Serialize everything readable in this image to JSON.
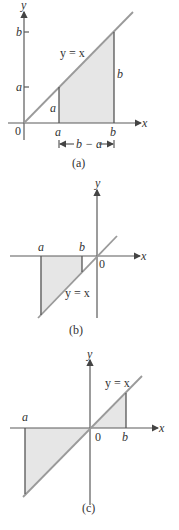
{
  "panels": [
    {
      "caption": "(a)",
      "axis_x": "x",
      "axis_y": "y",
      "origin": "0",
      "line_label": "y = x",
      "tick_a": "a",
      "tick_b": "b",
      "ytick_a": "a",
      "ytick_b": "b",
      "height_a": "a",
      "height_b": "b",
      "width_label": "b − a",
      "arrow_left": "|←",
      "arrow_right": "→|"
    },
    {
      "caption": "(b)",
      "axis_x": "x",
      "axis_y": "y",
      "origin": "0",
      "line_label": "y = x",
      "tick_a": "a",
      "tick_b": "b"
    },
    {
      "caption": "(c)",
      "axis_x": "x",
      "axis_y": "y",
      "origin": "0",
      "line_label": "y = x",
      "tick_a": "a",
      "tick_b": "b"
    }
  ],
  "colors": {
    "shade": "#e6e6e6",
    "line": "#9a9a9a",
    "axis": "#5a5a5a"
  }
}
